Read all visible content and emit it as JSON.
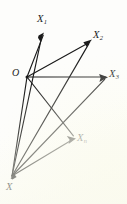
{
  "figure": {
    "kind": "vector-projection-diagram",
    "background_color": "#fdfdfb",
    "ink_color": "#1a1a1a",
    "width": 127,
    "height": 204
  },
  "labels": {
    "origin": "O",
    "x_point": "X",
    "x1_base": "X",
    "x1_sub": "1",
    "x2_base": "X",
    "x2_sub": "2",
    "x3_base": "X",
    "x3_sub": "3",
    "xn_base": "X",
    "xn_sub": "n"
  },
  "points": {
    "O": {
      "x": 27,
      "y": 77,
      "name": "origin"
    },
    "X": {
      "x": 12,
      "y": 176,
      "name": "x-point"
    },
    "X1": {
      "x": 44,
      "y": 33,
      "name": "x1-tip"
    },
    "X2": {
      "x": 92,
      "y": 40,
      "name": "x2-tip"
    },
    "X3": {
      "x": 108,
      "y": 77,
      "name": "x3-tip"
    },
    "Xn": {
      "x": 76,
      "y": 138,
      "name": "xn-tip"
    }
  },
  "edges": [
    {
      "id": "o-x1",
      "from": "O",
      "to": "X1",
      "arrow": true
    },
    {
      "id": "o-x2",
      "from": "O",
      "to": "X2",
      "arrow": true
    },
    {
      "id": "o-x3",
      "from": "O",
      "to": "X3",
      "arrow": true
    },
    {
      "id": "o-xn",
      "from": "O",
      "to": "Xn",
      "arrow": true
    },
    {
      "id": "x-o",
      "from": "X",
      "to": "O",
      "arrow": false
    },
    {
      "id": "x-x1",
      "from": "X",
      "to": "X1",
      "arrow": true
    },
    {
      "id": "x-x2",
      "from": "X",
      "to": "X2",
      "arrow": true
    },
    {
      "id": "x-x3",
      "from": "X",
      "to": "X3",
      "arrow": true
    },
    {
      "id": "x-xn",
      "from": "X",
      "to": "Xn",
      "arrow": true
    }
  ]
}
